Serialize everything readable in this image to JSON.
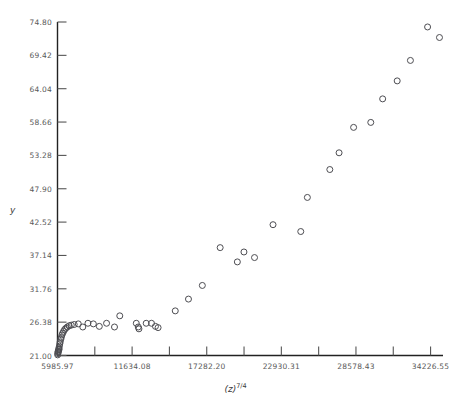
{
  "chart_data": {
    "type": "scatter",
    "title": "",
    "xlabel": "(z)^7/4",
    "xlabel_base": "(z)",
    "xlabel_exponent": "7/4",
    "ylabel": "y",
    "marker": "open-circle",
    "grid": false,
    "legend": null,
    "xlim": [
      5985.97,
      35167.24
    ],
    "ylim": [
      21.0,
      74.8
    ],
    "xticks": [
      5985.97,
      11634.08,
      17282.2,
      22930.31,
      28578.43,
      34226.55
    ],
    "xtick_labels": [
      "5985.97",
      "11634.08",
      "17282.20",
      "22930.31",
      "28578.43",
      "34226.55"
    ],
    "xminor_count_between": 1,
    "yticks": [
      21.0,
      26.38,
      31.76,
      37.14,
      42.52,
      47.9,
      53.28,
      58.66,
      64.04,
      69.42,
      74.8
    ],
    "ytick_labels": [
      "21.00",
      "26.38",
      "31.76",
      "37.14",
      "42.52",
      "47.90",
      "53.28",
      "58.66",
      "64.04",
      "69.42",
      "74.80"
    ],
    "points": [
      {
        "x": 6000,
        "y": 21.1
      },
      {
        "x": 6010,
        "y": 21.3
      },
      {
        "x": 6020,
        "y": 21.5
      },
      {
        "x": 6035,
        "y": 21.7
      },
      {
        "x": 6050,
        "y": 21.6
      },
      {
        "x": 6070,
        "y": 21.9
      },
      {
        "x": 6090,
        "y": 22.2
      },
      {
        "x": 6110,
        "y": 22.0
      },
      {
        "x": 6130,
        "y": 22.5
      },
      {
        "x": 6160,
        "y": 22.9
      },
      {
        "x": 6190,
        "y": 23.2
      },
      {
        "x": 6230,
        "y": 23.6
      },
      {
        "x": 6270,
        "y": 23.9
      },
      {
        "x": 6320,
        "y": 24.3
      },
      {
        "x": 6380,
        "y": 24.6
      },
      {
        "x": 6450,
        "y": 24.9
      },
      {
        "x": 6530,
        "y": 25.2
      },
      {
        "x": 6620,
        "y": 25.4
      },
      {
        "x": 6730,
        "y": 25.6
      },
      {
        "x": 6870,
        "y": 25.8
      },
      {
        "x": 7030,
        "y": 25.9
      },
      {
        "x": 7250,
        "y": 26.0
      },
      {
        "x": 7560,
        "y": 26.1
      },
      {
        "x": 7900,
        "y": 25.6
      },
      {
        "x": 8290,
        "y": 26.2
      },
      {
        "x": 8700,
        "y": 26.1
      },
      {
        "x": 9150,
        "y": 25.7
      },
      {
        "x": 9700,
        "y": 26.2
      },
      {
        "x": 10300,
        "y": 25.6
      },
      {
        "x": 10700,
        "y": 27.4
      },
      {
        "x": 11950,
        "y": 26.2
      },
      {
        "x": 12100,
        "y": 25.6
      },
      {
        "x": 12150,
        "y": 25.3
      },
      {
        "x": 12700,
        "y": 26.2
      },
      {
        "x": 13100,
        "y": 26.2
      },
      {
        "x": 13400,
        "y": 25.7
      },
      {
        "x": 13600,
        "y": 25.5
      },
      {
        "x": 14900,
        "y": 28.2
      },
      {
        "x": 15900,
        "y": 30.1
      },
      {
        "x": 16950,
        "y": 32.3
      },
      {
        "x": 18300,
        "y": 38.4
      },
      {
        "x": 19600,
        "y": 36.1
      },
      {
        "x": 20100,
        "y": 37.7
      },
      {
        "x": 20900,
        "y": 36.8
      },
      {
        "x": 22300,
        "y": 42.1
      },
      {
        "x": 24400,
        "y": 41.0
      },
      {
        "x": 24900,
        "y": 46.5
      },
      {
        "x": 26600,
        "y": 51.0
      },
      {
        "x": 27300,
        "y": 53.7
      },
      {
        "x": 28400,
        "y": 57.8
      },
      {
        "x": 29700,
        "y": 58.6
      },
      {
        "x": 30600,
        "y": 62.4
      },
      {
        "x": 31700,
        "y": 65.3
      },
      {
        "x": 32700,
        "y": 68.6
      },
      {
        "x": 34000,
        "y": 74.0
      },
      {
        "x": 34900,
        "y": 72.3
      }
    ]
  },
  "axes": {
    "y_axis_name": "y-axis",
    "x_axis_name": "x-axis"
  }
}
